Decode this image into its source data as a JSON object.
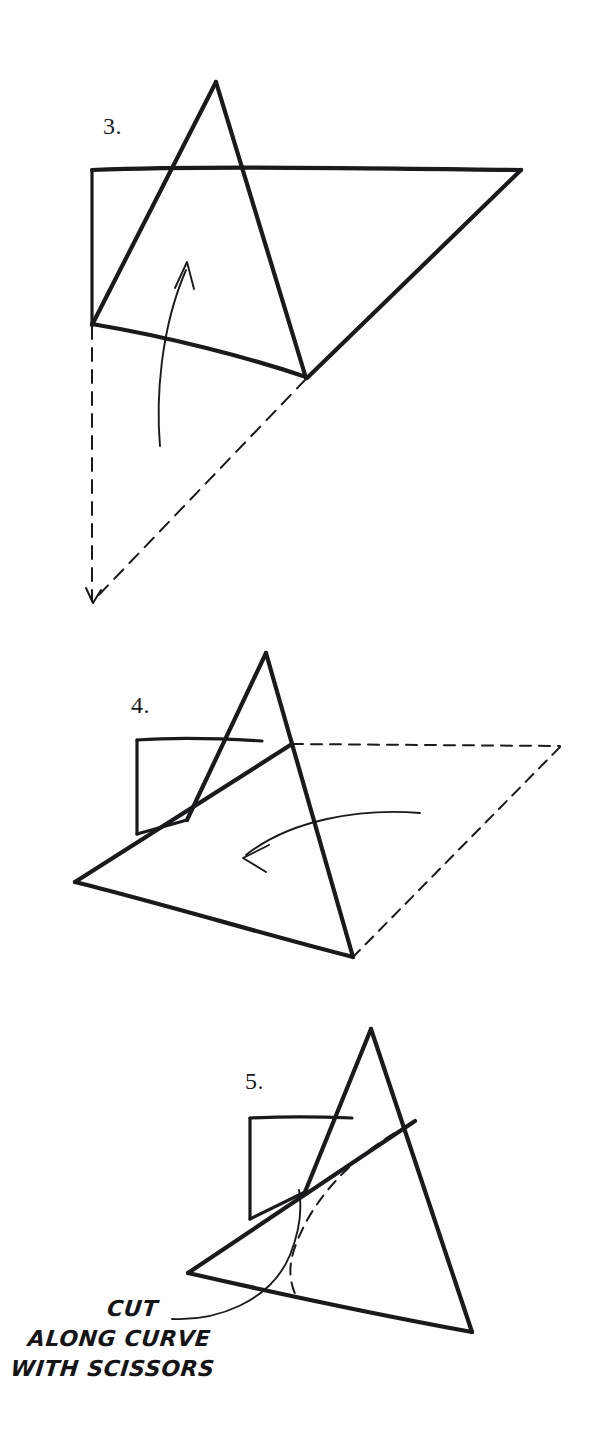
{
  "document": {
    "kind": "hand-drawn paper-folding instruction diagram",
    "background_color": "#ffffff",
    "ink_color": "#1a1a1c"
  },
  "steps": [
    {
      "id": "step-3",
      "number_label": "3.",
      "description": "Triangular flap standing upright over a square sheet, with a curved up-arrow indicating the fold direction, and dashed lines showing the hidden outline of the sheet below.",
      "arrow": "curved-up-arrow"
    },
    {
      "id": "step-4",
      "number_label": "4.",
      "description": "Triangle folded down toward the viewer, with a curved left-arrow showing the direction of the fold and dashed lines marking the former position.",
      "arrow": "curved-left-arrow"
    },
    {
      "id": "step-5",
      "number_label": "5.",
      "description": "Folded assembly with a dashed cutting curve drawn across it and a leader line pointing to the curve.",
      "arrow": "leader-line"
    }
  ],
  "caption": {
    "lines": [
      "CUT",
      "ALONG CURVE",
      "WITH SCISSORS"
    ],
    "line1": "CUT",
    "line2": "ALONG CURVE",
    "line3": "WITH SCISSORS"
  },
  "colors": {
    "ink": "#1a1a1c",
    "paper": "#ffffff"
  }
}
